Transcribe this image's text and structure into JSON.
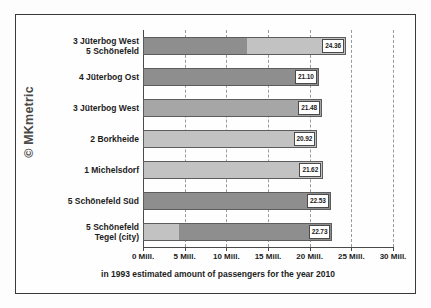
{
  "watermark": {
    "text": "© MKmetric"
  },
  "chart_data": {
    "type": "bar",
    "orientation": "horizontal",
    "title": "",
    "xlabel": "in 1993 estimated amount of passengers for the year 2010",
    "ylabel": "",
    "xlim": [
      0,
      30
    ],
    "grid": true,
    "legend": "none",
    "tick_labels": [
      "0 Mill.",
      "5 Mill.",
      "10 Mill.",
      "15 Mill.",
      "20 Mill.",
      "25 Mill.",
      "30 Mill."
    ],
    "ticks": [
      0,
      5,
      10,
      15,
      20,
      25,
      30
    ],
    "categories": [
      "3 Jüterbog West\n5 Schönefeld",
      "4 Jüterbog Ost",
      "3 Jüterbog West",
      "2 Borkheide",
      "1 Michelsdorf",
      "5 Schönefeld Süd",
      "5 Schönefeld\nTegel (city)"
    ],
    "values": [
      24.36,
      21.1,
      21.48,
      20.92,
      21.62,
      22.53,
      22.73
    ],
    "value_labels": [
      "24.36",
      "21.10",
      "21.48",
      "20.92",
      "21.62",
      "22.53",
      "22.73"
    ],
    "bars": [
      {
        "category_line1": "3 Jüterbog West",
        "category_line2": "5 Schönefeld",
        "value": 24.36,
        "label": "24.36",
        "segments": [
          {
            "from": 0,
            "to": 12.5,
            "shade": "seg-dark"
          },
          {
            "from": 12.5,
            "to": 24.36,
            "shade": "seg-light"
          }
        ]
      },
      {
        "category_line1": "4 Jüterbog Ost",
        "category_line2": "",
        "value": 21.1,
        "label": "21.10",
        "segments": [
          {
            "from": 0,
            "to": 21.1,
            "shade": "seg-dark"
          }
        ]
      },
      {
        "category_line1": "3 Jüterbog West",
        "category_line2": "",
        "value": 21.48,
        "label": "21.48",
        "segments": [
          {
            "from": 0,
            "to": 21.48,
            "shade": "seg-mid"
          }
        ]
      },
      {
        "category_line1": "2 Borkheide",
        "category_line2": "",
        "value": 20.92,
        "label": "20.92",
        "segments": [
          {
            "from": 0,
            "to": 20.92,
            "shade": "seg-light"
          }
        ]
      },
      {
        "category_line1": "1 Michelsdorf",
        "category_line2": "",
        "value": 21.62,
        "label": "21.62",
        "segments": [
          {
            "from": 0,
            "to": 21.62,
            "shade": "seg-light"
          }
        ]
      },
      {
        "category_line1": "5 Schönefeld Süd",
        "category_line2": "",
        "value": 22.53,
        "label": "22.53",
        "segments": [
          {
            "from": 0,
            "to": 22.53,
            "shade": "seg-dark"
          }
        ]
      },
      {
        "category_line1": "5 Schönefeld",
        "category_line2": "Tegel (city)",
        "value": 22.73,
        "label": "22.73",
        "segments": [
          {
            "from": 0,
            "to": 4.3,
            "shade": "seg-light"
          },
          {
            "from": 4.3,
            "to": 22.73,
            "shade": "seg-dark"
          }
        ]
      }
    ]
  }
}
